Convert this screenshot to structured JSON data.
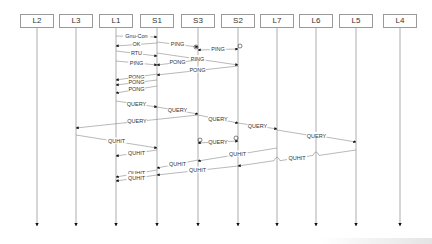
{
  "diagram": {
    "type": "sequence",
    "lifelines": [
      {
        "id": "L2",
        "label": "L2",
        "x": 37
      },
      {
        "id": "L3",
        "label": "L3",
        "x": 76
      },
      {
        "id": "L1",
        "label": "L1",
        "x": 116
      },
      {
        "id": "S1",
        "label": "S1",
        "x": 157
      },
      {
        "id": "S3",
        "label": "S3",
        "x": 198
      },
      {
        "id": "S2",
        "label": "S2",
        "x": 238
      },
      {
        "id": "L7",
        "label": "L7",
        "x": 277
      },
      {
        "id": "L6",
        "label": "L6",
        "x": 316
      },
      {
        "id": "L5",
        "label": "L5",
        "x": 356
      },
      {
        "id": "L4",
        "label": "L4",
        "x": 400
      }
    ],
    "messages": [
      {
        "label": "Gnu-Con",
        "from": "L1",
        "to": "S1",
        "y1": 36,
        "y2": 37
      },
      {
        "label": "OK",
        "from": "S1",
        "to": "L1",
        "y1": 43,
        "y2": 46
      },
      {
        "label": "PING",
        "from": "S1",
        "to": "S3",
        "y1": 42,
        "y2": 47
      },
      {
        "label": "PING",
        "from": "S3",
        "to": "S2",
        "y1": 50,
        "y2": 49,
        "lost_both_ends": true
      },
      {
        "label": "RTU",
        "from": "L1",
        "to": "S1",
        "y1": 51,
        "y2": 56
      },
      {
        "label": "PING",
        "from": "S1",
        "to": "S2",
        "y1": 53,
        "y2": 65
      },
      {
        "label": "PING",
        "from": "L1",
        "to": "S1",
        "y1": 61,
        "y2": 65
      },
      {
        "label": "PONG",
        "from": "S3",
        "to": "S1",
        "y1": 60,
        "y2": 65
      },
      {
        "label": "PONG",
        "from": "S2",
        "to": "S1",
        "y1": 66,
        "y2": 75
      },
      {
        "label": "PONG",
        "from": "S1",
        "to": "L1",
        "y1": 74,
        "y2": 80
      },
      {
        "label": "PONG",
        "from": "S1",
        "to": "L1",
        "y1": 80,
        "y2": 85
      },
      {
        "label": "PONG",
        "from": "S1",
        "to": "L1",
        "y1": 86,
        "y2": 93
      },
      {
        "label": "QUERY",
        "from": "L1",
        "to": "S1",
        "y1": 101,
        "y2": 107
      },
      {
        "label": "QUERY",
        "from": "S1",
        "to": "S3",
        "y1": 107,
        "y2": 114
      },
      {
        "label": "QUERY",
        "from": "S3",
        "to": "L3",
        "y1": 115,
        "y2": 128
      },
      {
        "label": "QUERY",
        "from": "S3",
        "to": "S2",
        "y1": 115,
        "y2": 123
      },
      {
        "label": "QUERY",
        "from": "S2",
        "to": "L7",
        "y1": 123,
        "y2": 129
      },
      {
        "label": "QUERY",
        "from": "L7",
        "to": "L5",
        "y1": 130,
        "y2": 142,
        "crosses": [
          "L6"
        ]
      },
      {
        "label": "QUERY",
        "from": "S2",
        "to": "S3",
        "y1": 141,
        "y2": 143,
        "lost_both_ends": true
      },
      {
        "label": "QUHIT",
        "from": "L3",
        "to": "S1",
        "y1": 135,
        "y2": 148
      },
      {
        "label": "QUHIT",
        "from": "S1",
        "to": "L1",
        "y1": 150,
        "y2": 156
      },
      {
        "label": "QUHIT",
        "from": "L7",
        "to": "S3",
        "y1": 148,
        "y2": 161
      },
      {
        "label": "QUHIT",
        "from": "L5",
        "to": "S2",
        "y1": 150,
        "y2": 166,
        "crosses": [
          "L6",
          "L7"
        ]
      },
      {
        "label": "QUHIT",
        "from": "S3",
        "to": "S1",
        "y1": 160,
        "y2": 168
      },
      {
        "label": "QUHIT",
        "from": "S2",
        "to": "S1",
        "y1": 166,
        "y2": 175
      },
      {
        "label": "QUHIT",
        "from": "S1",
        "to": "L1",
        "y1": 170,
        "y2": 177
      },
      {
        "label": "QUHIT",
        "from": "S1",
        "to": "L1",
        "y1": 175,
        "y2": 181
      }
    ],
    "colors": {
      "line": "#8a8a8a",
      "arrowhead": "#111111",
      "box_border": "#9a9a9a",
      "text": "#333333"
    }
  }
}
